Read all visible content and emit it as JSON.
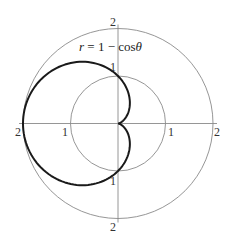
{
  "figure": {
    "type": "polar-plot",
    "equation": {
      "r": "r",
      "rest": " = 1 − cos",
      "theta": "θ",
      "full": "r = 1 − cosθ"
    },
    "curve": {
      "formula": "r = 1 - cos(theta)",
      "a": 1,
      "b": -1,
      "theta_range_deg": [
        0,
        360
      ],
      "color": "#1a1a1a",
      "stroke_width": 2
    },
    "grid": {
      "circles": [
        1,
        2
      ],
      "circle_color": "#8a8a8a",
      "axis_color": "#8a8a8a"
    },
    "axis_labels": {
      "top_outer": "2",
      "top_inner": "1",
      "bottom_inner": "1",
      "bottom_outer": "2",
      "left_outer": "2",
      "left_inner": "1",
      "right_inner": "1",
      "right_outer": "2"
    },
    "geometry": {
      "cx": 118,
      "cy": 123.5,
      "unit_px": 47.5
    }
  },
  "chart_data": {
    "type": "polar",
    "title": "r = 1 − cosθ",
    "series": [
      {
        "name": "cardioid",
        "formula": "r = 1 - cos(theta)",
        "theta_range_deg": [
          0,
          360
        ]
      }
    ],
    "radial_ticks": [
      1,
      2
    ],
    "axis_tick_labels": {
      "positive_x": [
        "1",
        "2"
      ],
      "negative_x": [
        "1",
        "2"
      ],
      "positive_y": [
        "1",
        "2"
      ],
      "negative_y": [
        "1",
        "2"
      ]
    },
    "rlim": [
      0,
      2
    ],
    "grid": true,
    "key_points": [
      {
        "theta_deg": 0,
        "r": 0
      },
      {
        "theta_deg": 90,
        "r": 1
      },
      {
        "theta_deg": 180,
        "r": 2
      },
      {
        "theta_deg": 270,
        "r": 1
      }
    ]
  }
}
